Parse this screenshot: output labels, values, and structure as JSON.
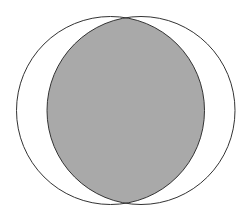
{
  "diagram": {
    "type": "venn-intersection",
    "shaded_region": "A ∩ B",
    "colors": {
      "background": "#ffffff",
      "outline": "#333333",
      "shade": "#a9a9a9"
    },
    "circles": [
      {
        "name": "A",
        "cx": 110.5,
        "cy": 110.5,
        "r": 94
      },
      {
        "name": "B",
        "cx": 141,
        "cy": 110.5,
        "r": 94
      }
    ]
  }
}
